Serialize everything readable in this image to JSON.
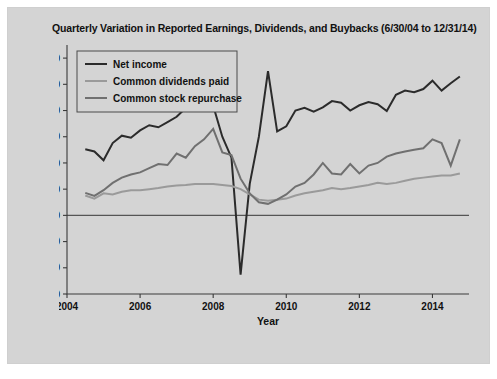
{
  "figure": {
    "background_color": "#d4d4d4",
    "page_background": "#ffffff"
  },
  "chart_data": {
    "type": "line",
    "title": "Quarterly Variation in Reported Earnings, Dividends, and Buybacks (6/30/04 to 12/31/14)",
    "xlabel": "Year",
    "ylabel": "",
    "xlim": [
      2004.0,
      2015.0
    ],
    "ylim": [
      -150.0,
      325.0
    ],
    "grid": false,
    "legend_position": "upper-left",
    "xticks": [
      2004,
      2006,
      2008,
      2010,
      2012,
      2014
    ],
    "xtick_labels": [
      "2004",
      "2006",
      "2008",
      "2010",
      "2012",
      "2014"
    ],
    "yticks": [
      -150.0,
      -100.0,
      -50.0,
      0,
      50.0,
      100.0,
      150.0,
      200.0,
      250.0,
      300.0
    ],
    "ytick_labels": [
      "-150.0",
      "-100.0",
      "-50.0",
      "0",
      "50.0",
      "100.0",
      "150.0",
      "200.0",
      "250.0",
      "300.0"
    ],
    "x": [
      2004.5,
      2004.75,
      2005.0,
      2005.25,
      2005.5,
      2005.75,
      2006.0,
      2006.25,
      2006.5,
      2006.75,
      2007.0,
      2007.25,
      2007.5,
      2007.75,
      2008.0,
      2008.25,
      2008.5,
      2008.75,
      2009.0,
      2009.25,
      2009.5,
      2009.75,
      2010.0,
      2010.25,
      2010.5,
      2010.75,
      2011.0,
      2011.25,
      2011.5,
      2011.75,
      2012.0,
      2012.25,
      2012.5,
      2012.75,
      2013.0,
      2013.25,
      2013.5,
      2013.75,
      2014.0,
      2014.25,
      2014.5,
      2014.75
    ],
    "series": [
      {
        "name": "Net income",
        "color": "#2b2b2b",
        "width": 2.0,
        "values": [
          126,
          122,
          105,
          138,
          152,
          148,
          162,
          172,
          168,
          178,
          188,
          205,
          210,
          210,
          209,
          150,
          110,
          -113,
          60,
          150,
          275,
          160,
          170,
          200,
          205,
          198,
          206,
          218,
          215,
          200,
          210,
          216,
          212,
          199,
          230,
          238,
          235,
          241,
          257,
          238,
          252,
          265
        ]
      },
      {
        "name": "Common dividends paid",
        "color": "#9a9a9a",
        "width": 2.0,
        "values": [
          38,
          32,
          42,
          40,
          45,
          48,
          48,
          50,
          52,
          55,
          57,
          58,
          60,
          60,
          60,
          58,
          56,
          50,
          40,
          30,
          28,
          30,
          32,
          38,
          42,
          45,
          48,
          52,
          50,
          52,
          55,
          58,
          62,
          60,
          62,
          66,
          70,
          72,
          74,
          76,
          76,
          80
        ]
      },
      {
        "name": "Common stock repurchase",
        "color": "#707070",
        "width": 2.0,
        "values": [
          43,
          37,
          48,
          62,
          72,
          78,
          82,
          90,
          98,
          96,
          118,
          110,
          132,
          145,
          165,
          120,
          115,
          70,
          42,
          25,
          22,
          30,
          40,
          55,
          62,
          78,
          100,
          80,
          78,
          98,
          80,
          95,
          100,
          112,
          118,
          122,
          125,
          128,
          145,
          138,
          95,
          145
        ]
      }
    ]
  }
}
